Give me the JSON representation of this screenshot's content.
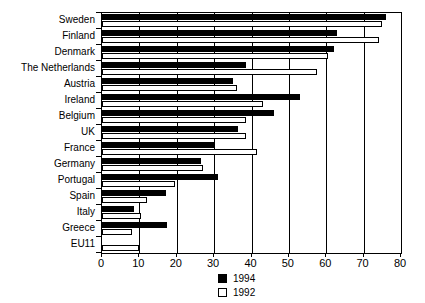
{
  "chart_data": {
    "type": "bar",
    "orientation": "horizontal",
    "title": "",
    "subtitle": "",
    "xlabel": "",
    "ylabel": "",
    "xlim": [
      0,
      80
    ],
    "xticks": [
      0,
      10,
      20,
      30,
      40,
      50,
      60,
      70,
      80
    ],
    "xtick_labels": [
      "0",
      "10",
      "20",
      "30",
      "40",
      "50",
      "60",
      "70",
      "80"
    ],
    "grid": "vertical",
    "legend_position": "bottom-center",
    "categories": [
      "Sweden",
      "Finland",
      "Denmark",
      "The Netherlands",
      "Austria",
      "Ireland",
      "Belgium",
      "UK",
      "France",
      "Germany",
      "Portugal",
      "Spain",
      "Italy",
      "Greece",
      "EU11"
    ],
    "series": [
      {
        "name": "1994",
        "color": "#000000",
        "style": "filled",
        "values": [
          76,
          63,
          62,
          38.5,
          35,
          53,
          46,
          36.5,
          30,
          26.5,
          31,
          17,
          8.5,
          17.5,
          0
        ]
      },
      {
        "name": "1992",
        "color": "#ffffff",
        "style": "hollow",
        "values": [
          75,
          74,
          60.5,
          57.5,
          36,
          43,
          38.5,
          38.5,
          41.5,
          27,
          19.5,
          12,
          10.5,
          8,
          10
        ]
      }
    ]
  },
  "legend": {
    "items": [
      {
        "label": "1994",
        "style": "filled"
      },
      {
        "label": "1992",
        "style": "hollow"
      }
    ]
  }
}
